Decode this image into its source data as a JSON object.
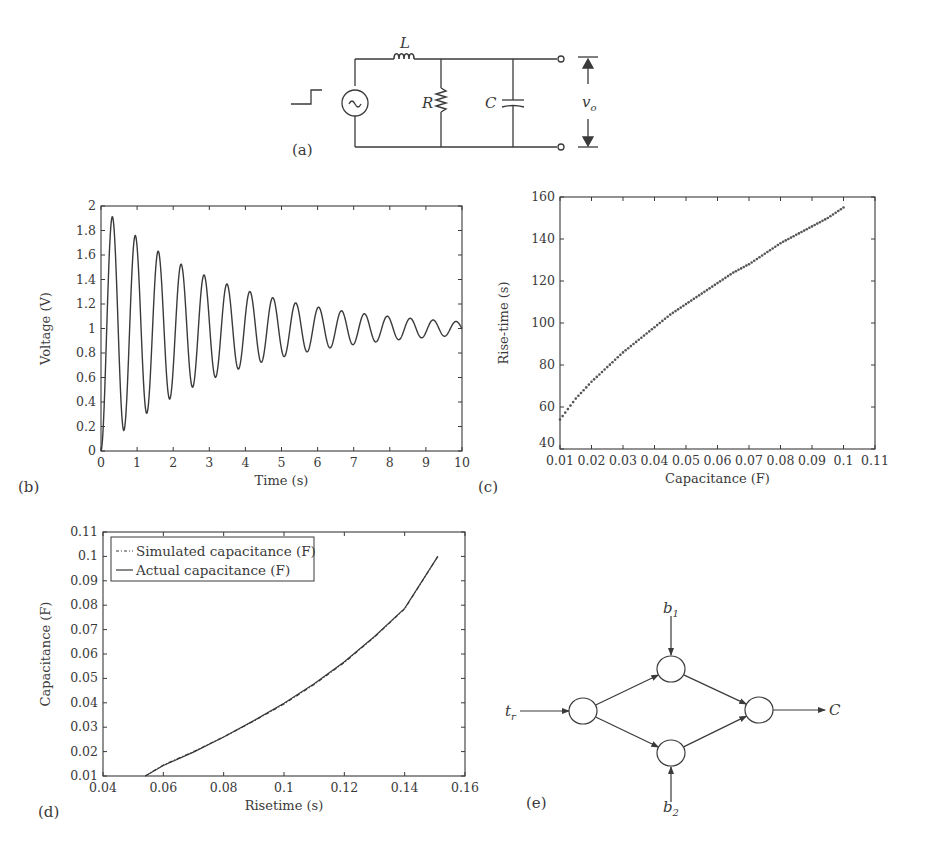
{
  "figure": {
    "panels": {
      "a": {
        "label": "(a)"
      },
      "b": {
        "label": "(b)"
      },
      "c": {
        "label": "(c)"
      },
      "d": {
        "label": "(d)"
      },
      "e": {
        "label": "(e)"
      }
    },
    "circuit": {
      "inductor_label": "L",
      "resistor_label": "R",
      "capacitor_label": "C",
      "output_label": "v",
      "output_subscript": "o",
      "source_glyph": "~",
      "input": "step"
    },
    "network": {
      "input_label": "t",
      "input_subscript": "r",
      "bias1_label": "b",
      "bias1_subscript": "1",
      "bias2_label": "b",
      "bias2_subscript": "2",
      "output_label": "C",
      "nodes": [
        {
          "id": "in",
          "cx": 583,
          "cy": 711
        },
        {
          "id": "h1",
          "cx": 671,
          "cy": 669
        },
        {
          "id": "h2",
          "cx": 671,
          "cy": 753
        },
        {
          "id": "out",
          "cx": 759,
          "cy": 710
        }
      ],
      "edges": [
        [
          "in",
          "h1"
        ],
        [
          "in",
          "h2"
        ],
        [
          "h1",
          "out"
        ],
        [
          "h2",
          "out"
        ]
      ]
    },
    "stroke_color": "#3a3a3a"
  },
  "chart_data": [
    {
      "id": "b",
      "type": "line",
      "title": "",
      "xlabel": "Time (s)",
      "ylabel": "Voltage (V)",
      "xlim": [
        0,
        10
      ],
      "ylim": [
        0,
        2
      ],
      "xticks": [
        0,
        1,
        2,
        3,
        4,
        5,
        6,
        7,
        8,
        9,
        10
      ],
      "yticks": [
        0,
        0.2,
        0.4,
        0.6,
        0.8,
        1,
        1.2,
        1.4,
        1.6,
        1.8,
        2
      ],
      "xtick_labels": [
        "0",
        "1",
        "2",
        "3",
        "4",
        "5",
        "6",
        "7",
        "8",
        "9",
        "10"
      ],
      "ytick_labels": [
        "0",
        "0.2",
        "0.4",
        "0.6",
        "0.8",
        "1",
        "1.2",
        "1.4",
        "1.6",
        "1.8",
        "2"
      ],
      "grid": false,
      "model": {
        "form": "1 - exp(-a t) cos(w t)",
        "a": 0.29,
        "w": 9.9,
        "settle": 1.0
      },
      "peaks": [
        {
          "t": 0.29,
          "v": 1.85
        },
        {
          "t": 0.93,
          "v": 1.61
        },
        {
          "t": 1.55,
          "v": 1.45
        },
        {
          "t": 2.19,
          "v": 1.32
        },
        {
          "t": 2.81,
          "v": 1.24
        },
        {
          "t": 3.44,
          "v": 1.17
        },
        {
          "t": 4.07,
          "v": 1.12
        },
        {
          "t": 4.7,
          "v": 1.09
        },
        {
          "t": 5.33,
          "v": 1.06
        }
      ],
      "troughs": [
        {
          "t": 0.62,
          "v": 0.27
        },
        {
          "t": 1.25,
          "v": 0.47
        },
        {
          "t": 1.88,
          "v": 0.61
        },
        {
          "t": 2.5,
          "v": 0.72
        },
        {
          "t": 3.13,
          "v": 0.8
        },
        {
          "t": 3.76,
          "v": 0.85
        },
        {
          "t": 4.39,
          "v": 0.89
        },
        {
          "t": 5.02,
          "v": 0.93
        }
      ],
      "steady_state": 1.0
    },
    {
      "id": "c",
      "type": "scatter",
      "title": "",
      "xlabel": "Capacitance (F)",
      "ylabel": "Rise-time (s)",
      "xlim": [
        0.01,
        0.11
      ],
      "ylim": [
        40,
        160
      ],
      "xticks": [
        0.01,
        0.02,
        0.03,
        0.04,
        0.05,
        0.06,
        0.07,
        0.08,
        0.09,
        0.1,
        0.11
      ],
      "yticks": [
        40,
        60,
        80,
        100,
        120,
        140,
        160
      ],
      "xtick_labels": [
        "0.01",
        "0.02",
        "0.03",
        "0.04",
        "0.05",
        "0.06",
        "0.07",
        "0.08",
        "0.09",
        "0.1",
        "0.11"
      ],
      "ytick_labels": [
        "40",
        "60",
        "80",
        "100",
        "120",
        "140",
        "160"
      ],
      "grid": false,
      "x": [
        0.01,
        0.015,
        0.02,
        0.025,
        0.03,
        0.035,
        0.04,
        0.045,
        0.05,
        0.055,
        0.06,
        0.065,
        0.07,
        0.075,
        0.08,
        0.085,
        0.09,
        0.095,
        0.1
      ],
      "y": [
        54,
        64,
        72,
        79,
        86,
        92,
        98,
        104,
        109,
        114,
        119,
        124,
        128,
        133,
        138,
        142,
        146,
        150,
        155
      ]
    },
    {
      "id": "d",
      "type": "line",
      "title": "",
      "xlabel": "Risetime (s)",
      "ylabel": "Capacitance (F)",
      "xlim": [
        0.04,
        0.16
      ],
      "ylim": [
        0.01,
        0.11
      ],
      "xticks": [
        0.04,
        0.06,
        0.08,
        0.1,
        0.12,
        0.14,
        0.16
      ],
      "yticks": [
        0.01,
        0.02,
        0.03,
        0.04,
        0.05,
        0.06,
        0.07,
        0.08,
        0.09,
        0.1,
        0.11
      ],
      "xtick_labels": [
        "0.04",
        "0.06",
        "0.08",
        "0.1",
        "0.12",
        "0.14",
        "0.16"
      ],
      "ytick_labels": [
        "0.01",
        "0.02",
        "0.03",
        "0.04",
        "0.05",
        "0.06",
        "0.07",
        "0.08",
        "0.09",
        "0.1",
        "0.11"
      ],
      "grid": false,
      "legend_position": "upper left",
      "legend": [
        "Simulated capacitance (F)",
        "Actual capacitance (F)"
      ],
      "series": [
        {
          "name": "Simulated capacitance (F)",
          "style": "dash-dot",
          "x": [
            0.054,
            0.06,
            0.07,
            0.08,
            0.09,
            0.1,
            0.11,
            0.12,
            0.13,
            0.14,
            0.151
          ],
          "y": [
            0.01,
            0.0145,
            0.02,
            0.026,
            0.0325,
            0.0395,
            0.0475,
            0.0565,
            0.067,
            0.0785,
            0.1
          ]
        },
        {
          "name": "Actual capacitance (F)",
          "style": "solid",
          "x": [
            0.054,
            0.06,
            0.07,
            0.08,
            0.09,
            0.1,
            0.11,
            0.12,
            0.13,
            0.14,
            0.151
          ],
          "y": [
            0.01,
            0.0143,
            0.0198,
            0.026,
            0.0327,
            0.0398,
            0.0478,
            0.0568,
            0.0672,
            0.0787,
            0.1
          ]
        }
      ]
    }
  ]
}
